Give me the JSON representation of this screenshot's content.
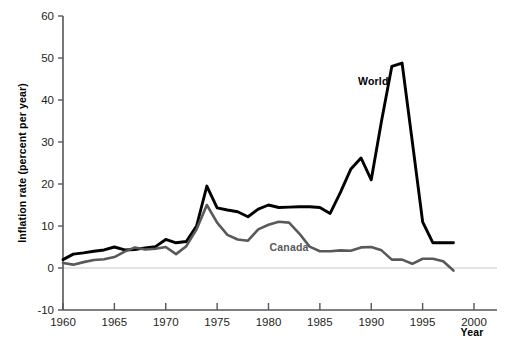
{
  "chart_data": {
    "type": "line",
    "title": "",
    "xlabel": "Year",
    "ylabel": "Inflation rate (percent per year)",
    "xlim": [
      1960,
      2000
    ],
    "ylim": [
      -10,
      60
    ],
    "xticks": [
      1960,
      1965,
      1970,
      1975,
      1980,
      1985,
      1990,
      1995,
      2000
    ],
    "xticklabels": [
      "1960",
      "1965",
      "1970",
      "1975",
      "1980",
      "1985",
      "1990",
      "1995",
      "2000"
    ],
    "yticks": [
      -10,
      0,
      10,
      20,
      30,
      40,
      50,
      60
    ],
    "yticklabels": [
      "-10",
      "0",
      "10",
      "20",
      "30",
      "40",
      "50",
      "60"
    ],
    "grid": false,
    "zero_reference_line": true,
    "legend": "inline-annotations",
    "x": [
      1960,
      1961,
      1962,
      1963,
      1964,
      1965,
      1966,
      1967,
      1968,
      1969,
      1970,
      1971,
      1972,
      1973,
      1974,
      1975,
      1976,
      1977,
      1978,
      1979,
      1980,
      1981,
      1982,
      1983,
      1984,
      1985,
      1986,
      1987,
      1988,
      1989,
      1990,
      1991,
      1992,
      1993,
      1994,
      1995,
      1996,
      1997,
      1998
    ],
    "series": [
      {
        "name": "World",
        "color": "#000000",
        "label_position": {
          "x": 1990.2,
          "y": 43.5
        },
        "values": [
          2.0,
          3.3,
          3.6,
          4.0,
          4.3,
          5.0,
          4.3,
          4.4,
          4.8,
          5.1,
          6.8,
          6.0,
          6.3,
          10.0,
          19.5,
          14.3,
          13.8,
          13.4,
          12.2,
          14.0,
          15.0,
          14.4,
          14.5,
          14.6,
          14.6,
          14.4,
          13.0,
          18.0,
          23.5,
          26.2,
          21.0,
          35.0,
          48.0,
          48.8,
          30.0,
          11.0,
          6.0,
          6.0,
          6.0
        ]
      },
      {
        "name": "Canada",
        "color": "#595959",
        "label_position": {
          "x": 1982.0,
          "y": 4.0
        },
        "values": [
          1.2,
          0.8,
          1.4,
          1.9,
          2.1,
          2.6,
          3.9,
          4.9,
          4.4,
          4.6,
          5.0,
          3.3,
          5.2,
          9.2,
          15.0,
          10.8,
          7.9,
          6.8,
          6.5,
          9.2,
          10.3,
          11.0,
          10.8,
          8.2,
          5.1,
          4.0,
          4.0,
          4.2,
          4.1,
          4.9,
          5.0,
          4.2,
          2.0,
          2.0,
          1.0,
          2.2,
          2.2,
          1.6,
          -0.6
        ]
      }
    ]
  }
}
